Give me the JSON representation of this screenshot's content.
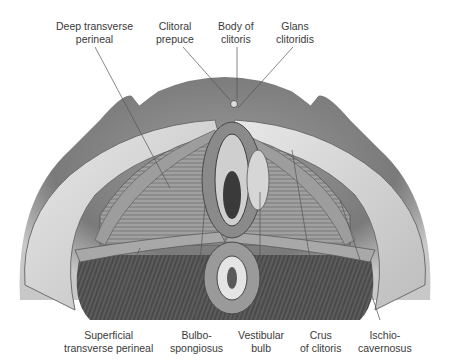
{
  "figure": {
    "style": "grayscale anatomical illustration"
  },
  "labels": {
    "top": [
      {
        "id": "deep-transverse-perineal",
        "line1": "Deep transverse",
        "line2": "perineal"
      },
      {
        "id": "clitoral-prepuce",
        "line1": "Clitoral",
        "line2": "prepuce"
      },
      {
        "id": "body-of-clitoris",
        "line1": "Body of",
        "line2": "clitoris"
      },
      {
        "id": "glans-clitoridis",
        "line1": "Glans",
        "line2": "clitoridis"
      }
    ],
    "bottom": [
      {
        "id": "superficial-transverse-perineal",
        "line1": "Superficial",
        "line2": "transverse perineal"
      },
      {
        "id": "bulbospongiosus",
        "line1": "Bulbo-",
        "line2": "spongiosus"
      },
      {
        "id": "vestibular-bulb",
        "line1": "Vestibular",
        "line2": "bulb"
      },
      {
        "id": "crus-of-clitoris",
        "line1": "Crus",
        "line2": "of clitoris"
      },
      {
        "id": "ischiocavernosus",
        "line1": "Ischio-",
        "line2": "cavernosus"
      }
    ]
  },
  "colors": {
    "background": "#ffffff",
    "label_text": "#3a3a3a",
    "leader_line": "#555555"
  }
}
